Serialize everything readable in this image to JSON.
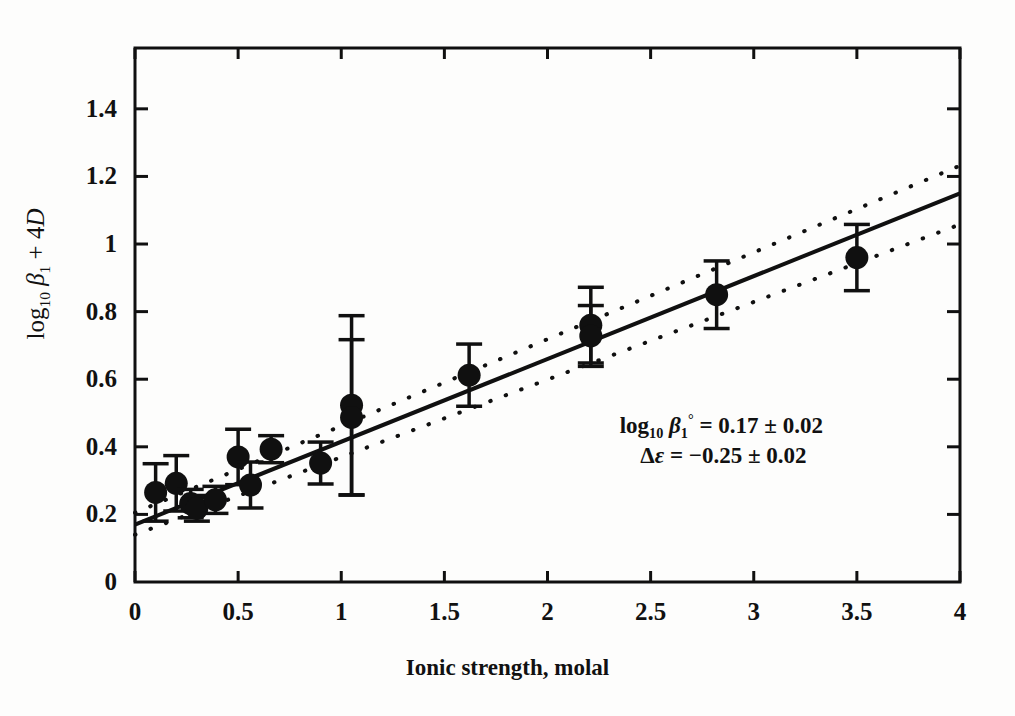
{
  "figure": {
    "y_axis_title": "log10 β1 + 4D",
    "x_axis_title": "Ionic strength, molal",
    "annotation_line1": "log10 β1° = 0.17 ± 0.02",
    "annotation_line2": "Δε = −0.25 ± 0.02",
    "annotation_intercept_value": "0.17",
    "annotation_intercept_error": "0.02",
    "annotation_depsilon_value": "−0.25",
    "annotation_depsilon_error": "0.02",
    "line_color": "#101010",
    "marker_color": "#101010",
    "background_color": "#ffffff"
  },
  "chart_data": {
    "type": "scatter",
    "title": "",
    "xlabel": "Ionic strength, molal",
    "ylabel": "log10 β1 + 4D",
    "xlim": [
      0,
      4
    ],
    "ylim": [
      0,
      1.58
    ],
    "xticks": [
      0,
      0.5,
      1,
      1.5,
      2,
      2.5,
      3,
      3.5,
      4
    ],
    "xtick_labels": [
      "0",
      "0.5",
      "1",
      "1.5",
      "2",
      "2.5",
      "3",
      "3.5",
      "4"
    ],
    "yticks": [
      0,
      0.2,
      0.4,
      0.6,
      0.8,
      1,
      1.2,
      1.4
    ],
    "ytick_labels": [
      "0",
      "0.2",
      "0.4",
      "0.6",
      "0.8",
      "1",
      "1.2",
      "1.4"
    ],
    "grid": false,
    "legend": false,
    "series": [
      {
        "name": "experimental points",
        "marker": "filled-circle",
        "points": [
          {
            "x": 0.1,
            "y": 0.265,
            "yerr_low": 0.085,
            "yerr_high": 0.085
          },
          {
            "x": 0.2,
            "y": 0.292,
            "yerr_low": 0.082,
            "yerr_high": 0.082
          },
          {
            "x": 0.27,
            "y": 0.232,
            "yerr_low": 0.042,
            "yerr_high": 0.042
          },
          {
            "x": 0.3,
            "y": 0.218,
            "yerr_low": 0.038,
            "yerr_high": 0.038
          },
          {
            "x": 0.39,
            "y": 0.243,
            "yerr_low": 0.04,
            "yerr_high": 0.04
          },
          {
            "x": 0.5,
            "y": 0.37,
            "yerr_low": 0.082,
            "yerr_high": 0.082
          },
          {
            "x": 0.56,
            "y": 0.287,
            "yerr_low": 0.068,
            "yerr_high": 0.068
          },
          {
            "x": 0.66,
            "y": 0.393,
            "yerr_low": 0.04,
            "yerr_high": 0.04
          },
          {
            "x": 0.9,
            "y": 0.352,
            "yerr_low": 0.062,
            "yerr_high": 0.062
          },
          {
            "x": 1.05,
            "y": 0.523,
            "yerr_low": 0.265,
            "yerr_high": 0.265
          },
          {
            "x": 1.05,
            "y": 0.487,
            "yerr_low": 0.23,
            "yerr_high": 0.23
          },
          {
            "x": 1.62,
            "y": 0.612,
            "yerr_low": 0.092,
            "yerr_high": 0.092
          },
          {
            "x": 2.21,
            "y": 0.76,
            "yerr_low": 0.112,
            "yerr_high": 0.112
          },
          {
            "x": 2.21,
            "y": 0.728,
            "yerr_low": 0.09,
            "yerr_high": 0.09
          },
          {
            "x": 2.82,
            "y": 0.85,
            "yerr_low": 0.1,
            "yerr_high": 0.1
          },
          {
            "x": 3.5,
            "y": 0.96,
            "yerr_low": 0.098,
            "yerr_high": 0.098
          }
        ]
      }
    ],
    "fit_line": {
      "name": "SIT regression line",
      "style": "solid",
      "intercept": 0.17,
      "slope": 0.245,
      "x_start": 0,
      "x_end": 4,
      "y_start": 0.17,
      "y_end": 1.15
    },
    "confidence_bands": [
      {
        "name": "upper 95% confidence band",
        "style": "dotted",
        "x_start": 0,
        "x_end": 4,
        "y_start": 0.205,
        "y_end": 1.232
      },
      {
        "name": "lower 95% confidence band",
        "style": "dotted",
        "x_start": 0,
        "x_end": 4,
        "y_start": 0.14,
        "y_end": 1.058
      }
    ],
    "annotations": [
      {
        "text": "log10 β1° = 0.17 ± 0.02",
        "x": 2.35,
        "y": 0.46
      },
      {
        "text": "Δε = −0.25 ± 0.02",
        "x": 2.45,
        "y": 0.37
      }
    ]
  }
}
